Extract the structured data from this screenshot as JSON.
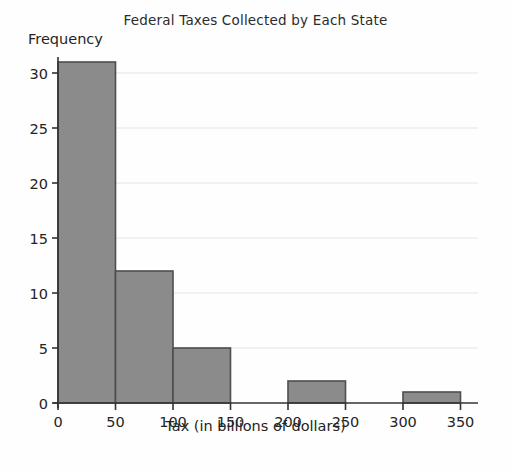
{
  "chart_data": {
    "type": "bar",
    "subtype": "histogram",
    "title": "Federal Taxes Collected by Each State",
    "xlabel": "Tax (in billions of dollars)",
    "ylabel": "Frequency",
    "bin_edges": [
      0,
      50,
      100,
      150,
      200,
      250,
      300,
      350
    ],
    "values": [
      31,
      12,
      5,
      0,
      2,
      0,
      1
    ],
    "x_ticks": [
      0,
      50,
      100,
      150,
      200,
      250,
      300,
      350
    ],
    "y_ticks": [
      0,
      5,
      10,
      15,
      20,
      25,
      30
    ],
    "xlim": [
      0,
      365
    ],
    "ylim": [
      0,
      31.5
    ],
    "grid": true,
    "legend": false,
    "colors": {
      "bar_fill": "#8b8b8b",
      "bar_stroke": "#4e4e4e",
      "axis": "#333333",
      "gridline": "#f1ebe8",
      "text": "#242424",
      "background": "#fefefe"
    }
  }
}
